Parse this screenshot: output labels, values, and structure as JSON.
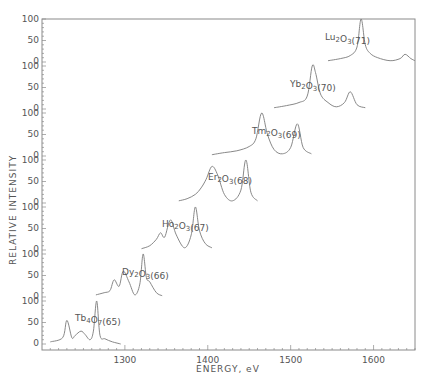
{
  "chart_data": {
    "type": "line",
    "title": "",
    "xlabel": "ENERGY, eV",
    "ylabel": "RELATIVE INTENSITY",
    "xlim": [
      1200,
      1650
    ],
    "x_ticks": [
      1300,
      1400,
      1500,
      1600
    ],
    "y_ticks_per_panel": [
      0,
      50,
      100
    ],
    "grid": false,
    "legend": "none (inline annotations)",
    "layout": "stacked offset spectra, 7 panels each scaled 0-100",
    "series": [
      {
        "name": "Tb4O7(65)",
        "label": "Tb",
        "sub1": "4",
        "mid": "O",
        "sub2": "7",
        "tail": "(65)",
        "x": [
          1210,
          1225,
          1230,
          1236,
          1240,
          1247,
          1252,
          1258,
          1262,
          1266,
          1270,
          1276,
          1285,
          1295
        ],
        "y": [
          5,
          15,
          55,
          15,
          20,
          30,
          22,
          10,
          30,
          100,
          20,
          12,
          5,
          0
        ]
      },
      {
        "name": "Dy2O3(66)",
        "label": "Dy",
        "sub1": "2",
        "mid": "O",
        "sub2": "3",
        "tail": "(66)",
        "x": [
          1265,
          1275,
          1282,
          1287,
          1293,
          1298,
          1305,
          1312,
          1318,
          1322,
          1326,
          1330,
          1338,
          1345
        ],
        "y": [
          5,
          10,
          15,
          40,
          25,
          60,
          35,
          5,
          30,
          100,
          45,
          35,
          10,
          3
        ]
      },
      {
        "name": "Ho2O3(67)",
        "label": "Ho",
        "sub1": "2",
        "mid": "O",
        "sub2": "3",
        "tail": "(67)",
        "x": [
          1320,
          1330,
          1338,
          1343,
          1348,
          1355,
          1362,
          1372,
          1380,
          1385,
          1390,
          1397,
          1405
        ],
        "y": [
          3,
          10,
          25,
          40,
          30,
          70,
          35,
          5,
          35,
          100,
          45,
          15,
          5
        ]
      },
      {
        "name": "Er2O3(68)",
        "label": "Er",
        "sub1": "2",
        "mid": "O",
        "sub2": "3",
        "tail": "(68)",
        "x": [
          1365,
          1375,
          1385,
          1392,
          1398,
          1405,
          1412,
          1420,
          1430,
          1440,
          1446,
          1452,
          1460
        ],
        "y": [
          5,
          10,
          20,
          35,
          55,
          85,
          65,
          20,
          5,
          30,
          100,
          25,
          5
        ]
      },
      {
        "name": "Tm2O3(69)",
        "label": "Tm",
        "sub1": "2",
        "mid": "O",
        "sub2": "3",
        "tail": "(69)",
        "x": [
          1405,
          1420,
          1435,
          1450,
          1458,
          1465,
          1472,
          1480,
          1490,
          1500,
          1508,
          1515,
          1525
        ],
        "y": [
          3,
          8,
          12,
          22,
          40,
          100,
          50,
          15,
          5,
          20,
          75,
          20,
          5
        ]
      },
      {
        "name": "Yb2O3(70)",
        "label": "Yb",
        "sub1": "2",
        "mid": "O",
        "sub2": "3",
        "tail": "(70)",
        "x": [
          1480,
          1495,
          1510,
          1520,
          1526,
          1530,
          1536,
          1545,
          1555,
          1565,
          1572,
          1580,
          1590
        ],
        "y": [
          3,
          8,
          15,
          30,
          100,
          85,
          35,
          15,
          5,
          15,
          40,
          10,
          3
        ]
      },
      {
        "name": "Lu2O3(71)",
        "label": "Lu",
        "sub1": "2",
        "mid": "O",
        "sub2": "3",
        "tail": "(71)",
        "x": [
          1545,
          1560,
          1572,
          1580,
          1585,
          1590,
          1596,
          1605,
          1620,
          1632,
          1638,
          1645,
          1650
        ],
        "y": [
          3,
          8,
          15,
          35,
          100,
          40,
          20,
          10,
          3,
          8,
          18,
          8,
          3
        ]
      }
    ]
  },
  "axes": {
    "y_tick_labels": [
      "100",
      "50",
      "0"
    ],
    "x_tick_labels": [
      "1300",
      "1400",
      "1500",
      "1600"
    ],
    "xlabel": "ENERGY, eV",
    "ylabel": "RELATIVE INTENSITY"
  }
}
